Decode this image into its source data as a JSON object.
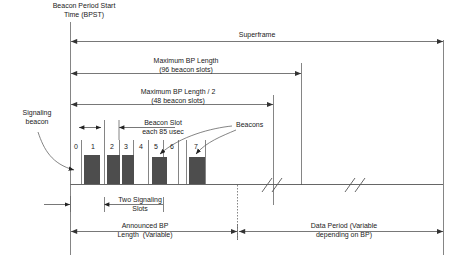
{
  "figure": {
    "title_labels": {
      "bpst": "Beacon Period Start\nTime (BPST)",
      "superframe": "Superframe",
      "max_bp_length": "Maximum BP Length\n(96 beacon slots)",
      "max_bp_length_half": "Maximum BP Length / 2\n(48 beacon slots)",
      "beacon_slot": "Beacon Slot\neach 85 usec",
      "signaling_beacon": "Signaling\nbeacon",
      "beacons": "Beacons",
      "two_signaling_slots": "Two Signaling\nSlots",
      "announced_bp": "Announced BP\nLength  (Variable)",
      "data_period": "Data Period (Variable\ndepending on BP)"
    }
  },
  "chart_data": {
    "type": "bar",
    "xlabel": "",
    "ylabel": "",
    "categories": [
      "0",
      "1",
      "2",
      "3",
      "4",
      "5",
      "6",
      "7"
    ],
    "values": [
      0,
      1,
      1,
      1,
      0,
      1,
      0,
      1
    ],
    "slot_occupied": [
      false,
      true,
      true,
      true,
      false,
      true,
      false,
      true
    ],
    "units": "beacon slot occupancy",
    "grid": false,
    "legend": "none",
    "annotations": [
      "Beacon Period Start Time (BPST)",
      "Superframe",
      "Maximum BP Length (96 beacon slots)",
      "Maximum BP Length / 2 (48 beacon slots)",
      "Beacon Slot each 85 usec",
      "Signaling beacon",
      "Beacons",
      "Two Signaling Slots",
      "Announced BP Length (Variable)",
      "Data Period (Variable depending on BP)"
    ],
    "bar_color": "#4d4d4d",
    "line_color": "#555555"
  },
  "slots": [
    {
      "num": "0",
      "filled": false
    },
    {
      "num": "1",
      "filled": true
    },
    {
      "num": "2",
      "filled": true
    },
    {
      "num": "3",
      "filled": true
    },
    {
      "num": "4",
      "filled": false
    },
    {
      "num": "5",
      "filled": true
    },
    {
      "num": "6",
      "filled": false
    },
    {
      "num": "7",
      "filled": true
    }
  ],
  "colors": {
    "bar": "#4d4d4d",
    "line": "#555555",
    "text": "#1a1a1a",
    "background": "#ffffff"
  }
}
